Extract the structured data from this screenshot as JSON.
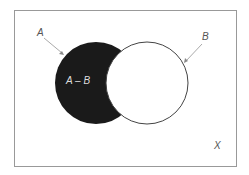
{
  "diagram": {
    "type": "venn",
    "universe_label": "X",
    "set_a_label": "A",
    "set_b_label": "B",
    "shaded_region_label": "A – B",
    "colors": {
      "border": "#999999",
      "circle_stroke": "#444444",
      "shade": "#1a1a1a",
      "arrow": "#aaaaaa",
      "text": "#555555",
      "shade_text": "#dddddd"
    }
  }
}
